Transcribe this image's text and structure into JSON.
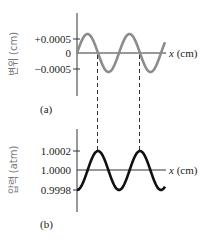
{
  "chart_data": [
    {
      "type": "line",
      "panel": "(a)",
      "ylabel": "변위 (cm)",
      "xlabel": "x (cm)",
      "yticks": [
        "+0.0005",
        "0",
        "−0.0005"
      ],
      "ytick_values": [
        0.0005,
        0,
        -0.0005
      ],
      "series": [
        {
          "name": "displacement",
          "color": "#8c8c8c",
          "shape": "sine",
          "amplitude": 0.0005,
          "cycles": 2.1
        }
      ]
    },
    {
      "type": "line",
      "panel": "(b)",
      "ylabel": "압력 (atm)",
      "xlabel": "x (cm)",
      "yticks": [
        "1.0002",
        "1.0000",
        "0.9998"
      ],
      "ytick_values": [
        1.0002,
        1.0,
        0.9998
      ],
      "series": [
        {
          "name": "pressure",
          "color": "#111111",
          "shape": "-cosine",
          "amplitude": 0.0002,
          "cycles": 2.1
        }
      ]
    }
  ],
  "panel_a": {
    "label": "(a)",
    "ylabel": "변위 (cm)",
    "xlabel_var": "x",
    "xlabel_unit": " (cm)",
    "ticks": [
      "+0.0005",
      "0",
      "−0.0005"
    ]
  },
  "panel_b": {
    "label": "(b)",
    "ylabel": "압력 (atm)",
    "xlabel_var": "x",
    "xlabel_unit": " (cm)",
    "ticks": [
      "1.0002",
      "1.0000",
      "0.9998"
    ]
  },
  "colors": {
    "wave_a": "#8c8c8c",
    "wave_b": "#111111",
    "axis": "#333333"
  }
}
